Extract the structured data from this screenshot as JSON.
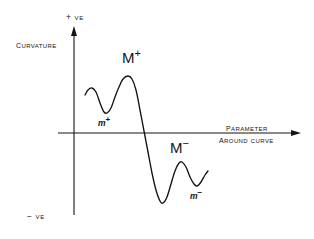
{
  "figure": {
    "title": "",
    "background_color": "#ffffff",
    "ink_color": "#141414"
  },
  "axes": {
    "y_axis": {
      "name": "curvature-axis",
      "title": "Curvature",
      "positive_end_label": "+ ve",
      "negative_end_label": "− ve",
      "x_pixel": 74,
      "top_pixel": 27,
      "bottom_pixel": 215
    },
    "x_axis": {
      "name": "parameter-axis",
      "title_line1": "Parameter",
      "title_line2": "Around Curve",
      "y_pixel": 133,
      "left_pixel": 58,
      "right_pixel": 300
    }
  },
  "annotations": [
    {
      "id": "M-plus",
      "text": "M",
      "superscript": "+",
      "kind": "major-maximum",
      "x": 128,
      "y": 76
    },
    {
      "id": "m-plus",
      "text": "m",
      "superscript": "+",
      "kind": "minor-minimum",
      "x": 105,
      "y": 113
    },
    {
      "id": "M-minus",
      "text": "M",
      "superscript": "−",
      "kind": "major-minimum-of-negative-lobe",
      "x": 180,
      "y": 162
    },
    {
      "id": "m-minus",
      "text": "m",
      "superscript": "−",
      "kind": "minor-minimum",
      "x": 197,
      "y": 186
    }
  ],
  "chart_data": {
    "type": "line",
    "title": "",
    "xlabel": "Parameter Around Curve",
    "ylabel": "Curvature",
    "grid": false,
    "legend": null,
    "axis_ticks": {
      "x": [],
      "y": [
        "+ ve",
        "− ve"
      ]
    },
    "xlim": [
      58,
      300
    ],
    "ylim_pixels": [
      27,
      215
    ],
    "zero_line_y_pixel": 133,
    "series": [
      {
        "name": "curvature-profile",
        "color": "#141414",
        "points_pixels": [
          [
            85,
            95
          ],
          [
            88,
            90
          ],
          [
            92,
            88
          ],
          [
            96,
            92
          ],
          [
            100,
            103
          ],
          [
            104,
            112
          ],
          [
            107,
            113
          ],
          [
            111,
            108
          ],
          [
            115,
            97
          ],
          [
            119,
            87
          ],
          [
            123,
            79
          ],
          [
            128,
            76
          ],
          [
            132,
            79
          ],
          [
            136,
            90
          ],
          [
            140,
            110
          ],
          [
            144,
            131
          ],
          [
            148,
            152
          ],
          [
            152,
            173
          ],
          [
            156,
            190
          ],
          [
            160,
            201
          ],
          [
            163,
            203
          ],
          [
            167,
            197
          ],
          [
            171,
            184
          ],
          [
            175,
            171
          ],
          [
            179,
            163
          ],
          [
            182,
            162
          ],
          [
            186,
            167
          ],
          [
            190,
            177
          ],
          [
            194,
            184
          ],
          [
            197,
            186
          ],
          [
            201,
            182
          ],
          [
            205,
            175
          ],
          [
            208,
            171
          ]
        ],
        "described_extrema": [
          {
            "label": "m⁺",
            "type": "local-minimum",
            "pixel": [
              105,
              113
            ]
          },
          {
            "label": "M⁺",
            "type": "global-maximum",
            "pixel": [
              128,
              76
            ]
          },
          {
            "label": "M⁻",
            "type": "local-maximum-negative-region",
            "pixel": [
              180,
              162
            ]
          },
          {
            "label": "m⁻",
            "type": "local-minimum-negative-region",
            "pixel": [
              197,
              186
            ]
          }
        ],
        "axis_crossings_pixels": [
          [
            145,
            133
          ]
        ]
      }
    ]
  }
}
